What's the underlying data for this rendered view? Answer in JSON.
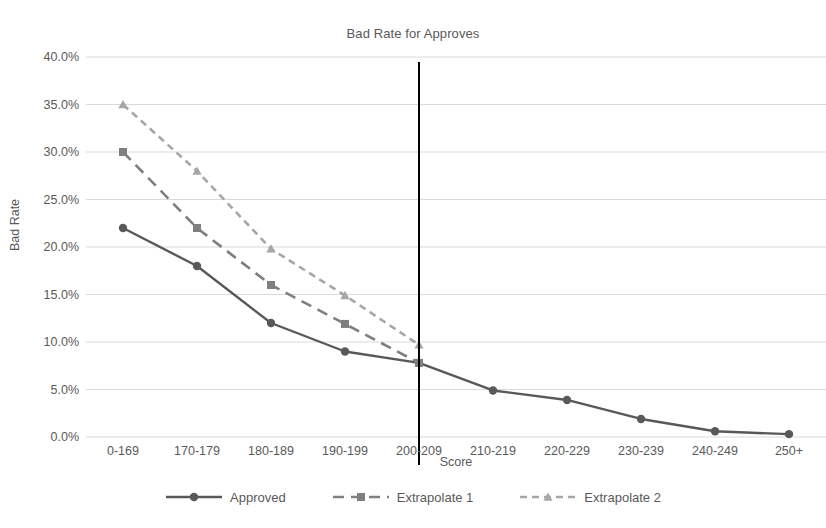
{
  "chart_data": {
    "type": "line",
    "title": "Bad Rate for Approves",
    "xlabel": "Score",
    "ylabel": "Bad Rate",
    "categories": [
      "0-169",
      "170-179",
      "180-189",
      "190-199",
      "200-209",
      "210-219",
      "220-229",
      "230-239",
      "240-249",
      "250+"
    ],
    "ylim": [
      0,
      40
    ],
    "ytick_labels": [
      "0.0%",
      "5.0%",
      "10.0%",
      "15.0%",
      "20.0%",
      "25.0%",
      "30.0%",
      "35.0%",
      "40.0%"
    ],
    "ytick_values": [
      0,
      5,
      10,
      15,
      20,
      25,
      30,
      35,
      40
    ],
    "grid": true,
    "legend_position": "bottom",
    "annotations": [
      {
        "name": "cutoff-line",
        "type": "vline",
        "x_category": "200-209",
        "color": "#000000"
      }
    ],
    "series": [
      {
        "name": "Approved",
        "marker": "circle",
        "line_style": "solid",
        "color": "#595959",
        "values": [
          22.0,
          18.0,
          12.0,
          9.0,
          7.8,
          4.9,
          3.9,
          1.9,
          0.6,
          0.3
        ]
      },
      {
        "name": "Extrapolate 1",
        "marker": "square",
        "line_style": "dashed",
        "color": "#7f7f7f",
        "values": [
          30.0,
          22.0,
          16.0,
          11.9,
          7.8,
          null,
          null,
          null,
          null,
          null
        ]
      },
      {
        "name": "Extrapolate 2",
        "marker": "triangle",
        "line_style": "dotted-dash",
        "color": "#a6a6a6",
        "values": [
          35.0,
          28.0,
          19.8,
          14.9,
          9.7,
          null,
          null,
          null,
          null,
          null
        ]
      }
    ]
  },
  "legend": {
    "items": [
      {
        "label": "Approved"
      },
      {
        "label": "Extrapolate 1"
      },
      {
        "label": "Extrapolate 2"
      }
    ]
  }
}
